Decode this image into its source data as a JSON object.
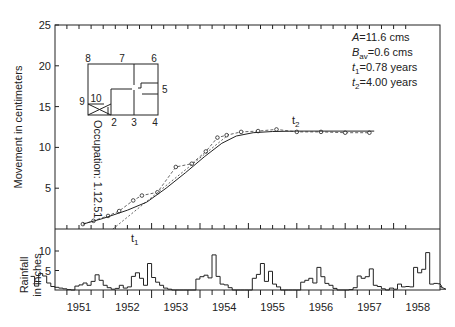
{
  "chart_data": [
    {
      "type": "line",
      "title": "",
      "xlabel": "",
      "ylabel": "Movement in centimeters",
      "ylim": [
        0,
        25
      ],
      "yticks": [
        5,
        10,
        15,
        20,
        25
      ],
      "xlim": [
        1950.5,
        1958.4
      ],
      "categories": [
        "1951",
        "1952",
        "1953",
        "1954",
        "1955",
        "1956",
        "1957",
        "1958"
      ],
      "series": [
        {
          "name": "Observed movement",
          "style": "circles",
          "x": [
            1951.58,
            1951.8,
            1952.1,
            1952.33,
            1952.62,
            1952.8,
            1953.12,
            1953.5,
            1953.83,
            1954.12,
            1954.36,
            1954.55,
            1954.85,
            1955.2,
            1955.58,
            1956.0,
            1956.5,
            1957.0,
            1957.5
          ],
          "y": [
            0.6,
            1.0,
            1.6,
            2.2,
            3.5,
            4.1,
            4.5,
            7.6,
            8.0,
            9.5,
            11.2,
            11.5,
            11.9,
            12.0,
            12.2,
            11.9,
            11.9,
            11.8,
            11.8
          ]
        },
        {
          "name": "Fitted curve",
          "style": "solid",
          "x": [
            1951.58,
            1952.0,
            1952.5,
            1952.9,
            1953.3,
            1953.7,
            1954.1,
            1954.45,
            1954.75,
            1955.1,
            1955.5,
            1956.0,
            1957.0,
            1957.6
          ],
          "y": [
            0.6,
            1.3,
            2.3,
            3.3,
            5.0,
            6.9,
            8.9,
            10.5,
            11.4,
            11.8,
            11.95,
            12.0,
            12.0,
            12.0
          ]
        },
        {
          "name": "Tangent at t1",
          "style": "dashed",
          "x": [
            1952.2,
            1954.6
          ],
          "y": [
            0.0,
            11.6
          ]
        }
      ],
      "annotations": [
        {
          "text": "t1",
          "x": 1952.25,
          "y": -1.2
        },
        {
          "text": "t2",
          "x": 1955.1,
          "y": 12.7
        },
        {
          "text": "Occupation: 1.12.51",
          "rotation": 90
        },
        {
          "text": "A=11.6 cms"
        },
        {
          "text": "Bav=0.6 cms"
        },
        {
          "text": "t1=0.78 years"
        },
        {
          "text": "t2=4.00 years"
        }
      ]
    },
    {
      "type": "bar",
      "style": "step",
      "ylabel": "Rainfall in inches",
      "ylim": [
        0,
        12
      ],
      "yticks": [
        5,
        10
      ],
      "xlim": [
        1950.5,
        1958.4
      ],
      "x_start": 1950.5,
      "bin_width_years": 0.0833,
      "values": [
        3.5,
        1.0,
        4.2,
        3.6,
        1.8,
        0.9,
        0.7,
        0.5,
        0.3,
        0.1,
        0.0,
        1.0,
        1.3,
        1.8,
        1.2,
        2.2,
        3.9,
        2.5,
        1.2,
        0.6,
        0.2,
        0.4,
        1.2,
        0.5,
        0.8,
        3.5,
        4.4,
        3.0,
        1.2,
        6.8,
        3.2,
        2.0,
        1.2,
        0.5,
        0.2,
        0.0,
        0.0,
        0.0,
        0.0,
        0.0,
        0.0,
        2.8,
        3.4,
        3.8,
        3.1,
        9.0,
        3.5,
        1.5,
        1.3,
        0.6,
        0.0,
        0.0,
        0.0,
        0.0,
        0.0,
        3.0,
        4.0,
        6.8,
        2.2,
        4.8,
        1.5,
        0.8,
        0.0,
        0.0,
        0.0,
        0.0,
        0.0,
        2.0,
        2.5,
        3.0,
        1.8,
        5.8,
        3.4,
        1.7,
        1.2,
        0.4,
        0.0,
        0.0,
        0.0,
        0.1,
        0.6,
        3.6,
        3.0,
        3.4,
        5.4,
        1.2,
        0.9,
        0.3,
        0.0,
        0.5,
        0.2,
        1.5,
        0.8,
        0.9,
        0.8,
        5.8,
        4.4,
        5.3,
        9.6,
        1.5,
        1.7,
        1.6,
        0.9,
        0.2
      ]
    }
  ],
  "labels": {
    "y_main": "Movement in centimeters",
    "y_rain_line1": "Rainfall",
    "y_rain_line2": "in inches",
    "occupation": "Occupation: 1.12.51",
    "t1": "t",
    "t1_sub": "1",
    "t2": "t",
    "t2_sub": "2",
    "params": {
      "A": {
        "sym": "A",
        "sub": "",
        "val": "=11.6 cms"
      },
      "Bav": {
        "sym": "B",
        "sub": "av",
        "val": "=0.6 cms"
      },
      "t1": {
        "sym": "t",
        "sub": "1",
        "val": "=0.78 years"
      },
      "t2": {
        "sym": "t",
        "sub": "2",
        "val": "=4.00 years"
      }
    },
    "house_numbers": [
      "1",
      "2",
      "3",
      "4",
      "5",
      "6",
      "7",
      "8",
      "9",
      "10"
    ]
  },
  "colors": {
    "ink": "#222222",
    "background": "#ffffff"
  }
}
